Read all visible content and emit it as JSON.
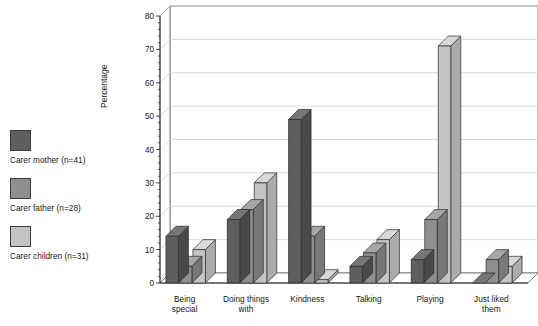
{
  "chart_data": {
    "type": "bar",
    "title": "",
    "subtitle": "",
    "xlabel": "",
    "ylabel": "Percentage",
    "ylim": [
      0,
      80
    ],
    "ytick_step": 10,
    "yticks": [
      0,
      10,
      20,
      30,
      40,
      50,
      60,
      70,
      80
    ],
    "grid": true,
    "grid_axis": "y",
    "three_d": true,
    "legend_position": "left-outside",
    "categories": [
      "Being\nspecial",
      "Doing things\nwith",
      "Kindness",
      "Talking",
      "Playing",
      "Just liked\nthem"
    ],
    "category_lines": [
      [
        "Being",
        "special"
      ],
      [
        "Doing things",
        "with"
      ],
      [
        "Kindness",
        ""
      ],
      [
        "Talking",
        ""
      ],
      [
        "Playing",
        ""
      ],
      [
        "Just liked",
        "them"
      ]
    ],
    "series": [
      {
        "name": "Carer mother (n=41)",
        "color": "#5e5e5e",
        "top_color": "#767676",
        "side_color": "#4a4a4a",
        "values": [
          14,
          19,
          49,
          5,
          7,
          0
        ]
      },
      {
        "name": "Carer father (n=28)",
        "color": "#8f8f8f",
        "top_color": "#a6a6a6",
        "side_color": "#787878",
        "values": [
          5,
          22,
          14,
          9,
          19,
          7
        ]
      },
      {
        "name": "Carer children (n=31)",
        "color": "#c4c4c4",
        "top_color": "#d8d8d8",
        "side_color": "#ababab",
        "values": [
          10,
          30,
          1,
          13,
          71,
          5
        ]
      }
    ]
  },
  "legend": {
    "items": [
      {
        "label": "Carer mother (n=41)",
        "color": "#5e5e5e"
      },
      {
        "label": "Carer father (n=28)",
        "color": "#8f8f8f"
      },
      {
        "label": "Carer children (n=31)",
        "color": "#c4c4c4"
      }
    ]
  },
  "axis": {
    "y_title": "Percentage"
  }
}
